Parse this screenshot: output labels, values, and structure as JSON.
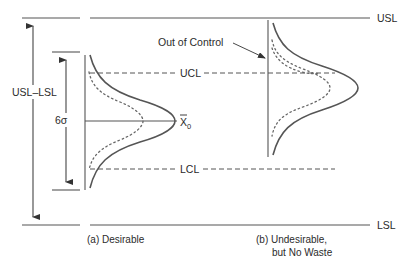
{
  "labels": {
    "usl": "USL",
    "lsl": "LSL",
    "ucl": "UCL",
    "lcl": "LCL",
    "spec_width": "USL–LSL",
    "six_sigma": "6σ",
    "center_symbol": "X",
    "center_subscript": "0",
    "out_of_control": "Out of Control"
  },
  "captions": {
    "a": "(a) Desirable",
    "b_line1": "(b) Undesirable,",
    "b_line2": "but No Waste"
  },
  "colors": {
    "line": "#555555",
    "text": "#2b2b2b"
  }
}
